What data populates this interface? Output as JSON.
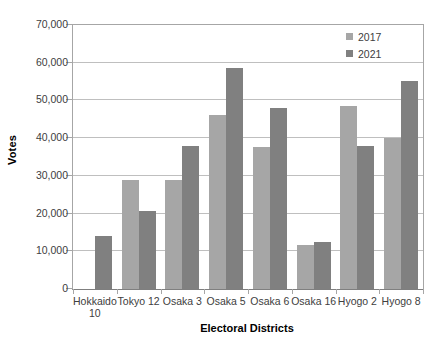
{
  "chart_data": {
    "type": "bar",
    "title": "",
    "xlabel": "Electoral Districts",
    "ylabel": "Votes",
    "categories": [
      "Hokkaido 10",
      "Tokyo 12",
      "Osaka 3",
      "Osaka 5",
      "Osaka 6",
      "Osaka 16",
      "Hyogo 2",
      "Hyogo 8"
    ],
    "series": [
      {
        "name": "2017",
        "color": "#A6A6A6",
        "values": [
          0,
          29000,
          29000,
          46200,
          37600,
          11700,
          48500,
          40000
        ]
      },
      {
        "name": "2021",
        "color": "#808080",
        "values": [
          14000,
          20800,
          38000,
          58500,
          47900,
          12400,
          37800,
          55200
        ]
      }
    ],
    "ylim": [
      0,
      70000
    ],
    "ytick_labels": [
      "0",
      "10,000",
      "20,000",
      "30,000",
      "40,000",
      "50,000",
      "60,000",
      "70,000"
    ],
    "ytick_values": [
      0,
      10000,
      20000,
      30000,
      40000,
      50000,
      60000,
      70000
    ],
    "grid": true,
    "legend_position": "top-right"
  },
  "legend": {
    "items": [
      {
        "label": "2017"
      },
      {
        "label": "2021"
      }
    ]
  },
  "axes": {
    "y_title": "Votes",
    "x_title": "Electoral Districts"
  }
}
